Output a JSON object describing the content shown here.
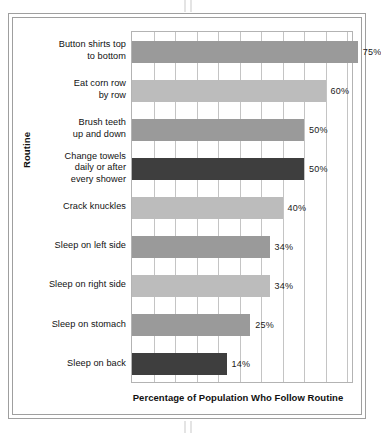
{
  "chart_data": {
    "type": "bar",
    "orientation": "horizontal",
    "title": "",
    "xlabel": "Percentage of Population Who Follow Routine",
    "ylabel": "Routine",
    "categories": [
      "Button shirts top to bottom",
      "Eat corn row by row",
      "Brush teeth up and down",
      "Change towels daily or after every shower",
      "Crack knuckles",
      "Sleep on left side",
      "Sleep on right side",
      "Sleep on stomach",
      "Sleep on back"
    ],
    "values": [
      75,
      60,
      50,
      50,
      40,
      34,
      34,
      25,
      14
    ],
    "value_labels": [
      "75%",
      "60%",
      "50%",
      "50%",
      "40%",
      "34%",
      "34%",
      "25%",
      "14%"
    ],
    "bar_colors": [
      "#9a9a9a",
      "#bcbcbc",
      "#9a9a9a",
      "#3e3e3e",
      "#bcbcbc",
      "#9a9a9a",
      "#bcbcbc",
      "#9a9a9a",
      "#3e3e3e"
    ],
    "xlim": [
      0,
      100
    ],
    "grid": true,
    "gridline_step": 10,
    "legend": "none"
  },
  "axis": {
    "y_title": "Routine",
    "x_title": "Percentage of Population Who Follow Routine"
  },
  "rows": [
    {
      "label_line1": "Button shirts top",
      "label_line2": "to bottom",
      "label": "Button shirts top to bottom",
      "value": "75%"
    },
    {
      "label_line1": "Eat corn row",
      "label_line2": "by row",
      "label": "Eat corn row by row",
      "value": "60%"
    },
    {
      "label_line1": "Brush teeth",
      "label_line2": "up and down",
      "label": "Brush teeth up and down",
      "value": "50%"
    },
    {
      "label_line1": "Change towels",
      "label_line2": "daily or after",
      "label_line3": "every shower",
      "label": "Change towels daily or after every shower",
      "value": "50%"
    },
    {
      "label_line1": "Crack knuckles",
      "label": "Crack knuckles",
      "value": "40%"
    },
    {
      "label_line1": "Sleep on left side",
      "label": "Sleep on left side",
      "value": "34%"
    },
    {
      "label_line1": "Sleep on right side",
      "label": "Sleep on right side",
      "value": "34%"
    },
    {
      "label_line1": "Sleep on stomach",
      "label": "Sleep on stomach",
      "value": "25%"
    },
    {
      "label_line1": "Sleep on back",
      "label": "Sleep on back",
      "value": "14%"
    }
  ]
}
